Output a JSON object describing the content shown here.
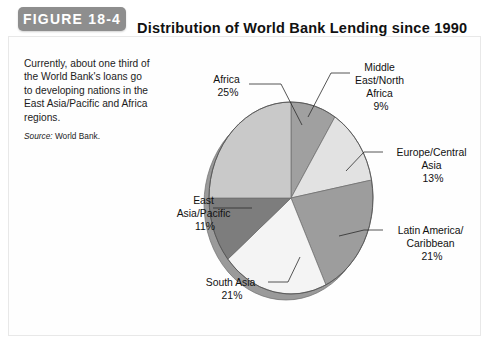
{
  "figure": {
    "tag_label": "FIGURE 18-4",
    "title": "Distribution of World Bank Lending since 1990"
  },
  "caption": {
    "text": "Currently, about one third of the World Bank's loans go to developing nations in the East Asia/Pacific and Africa regions.",
    "source_label": "Source:",
    "source_value": "World Bank."
  },
  "colors": {
    "figure_tag_bg": "#8e8e8e",
    "pie_shadow": "#9a9a9a",
    "pie_outline": "#6f6f6f",
    "africa": "#c9c9c9",
    "middle_east_north_africa": "#a0a0a0",
    "europe_central_asia": "#e2e2e2",
    "latin_america_caribbean": "#9d9d9d",
    "south_asia": "#f4f4f4",
    "east_asia_pacific": "#7d7d7d"
  },
  "chart_data": {
    "type": "pie",
    "title": "Distribution of World Bank Lending since 1990",
    "units": "percent",
    "legend": "none",
    "labels_outside": true,
    "start_angle_deg": 0,
    "direction": "clockwise",
    "categories": [
      "Middle East/North Africa",
      "Europe/Central Asia",
      "Latin America/Caribbean",
      "South Asia",
      "East Asia/Pacific",
      "Africa"
    ],
    "values": [
      9,
      13,
      21,
      21,
      11,
      25
    ],
    "slices": [
      {
        "name": "Middle East/North Africa",
        "label_lines": [
          "Middle",
          "East/North",
          "Africa",
          "9%"
        ],
        "value": 9,
        "value_text": "9%",
        "color": "#a0a0a0"
      },
      {
        "name": "Europe/Central Asia",
        "label_lines": [
          "Europe/Central",
          "Asia",
          "13%"
        ],
        "value": 13,
        "value_text": "13%",
        "color": "#e2e2e2"
      },
      {
        "name": "Latin America/Caribbean",
        "label_lines": [
          "Latin America/",
          "Caribbean",
          "21%"
        ],
        "value": 21,
        "value_text": "21%",
        "color": "#9d9d9d"
      },
      {
        "name": "South Asia",
        "label_lines": [
          "South Asia",
          "21%"
        ],
        "value": 21,
        "value_text": "21%",
        "color": "#f4f4f4"
      },
      {
        "name": "East Asia/Pacific",
        "label_lines": [
          "East",
          "Asia/Pacific",
          "11%"
        ],
        "value": 11,
        "value_text": "11%",
        "color": "#7d7d7d"
      },
      {
        "name": "Africa",
        "label_lines": [
          "Africa",
          "25%"
        ],
        "value": 25,
        "value_text": "25%",
        "color": "#c9c9c9"
      }
    ]
  },
  "labels": {
    "africa_l1": "Africa",
    "africa_l2": "25%",
    "mena_l1": "Middle",
    "mena_l2": "East/North",
    "mena_l3": "Africa",
    "mena_l4": "9%",
    "eca_l1": "Europe/Central",
    "eca_l2": "Asia",
    "eca_l3": "13%",
    "lac_l1": "Latin America/",
    "lac_l2": "Caribbean",
    "lac_l3": "21%",
    "sa_l1": "South Asia",
    "sa_l2": "21%",
    "eap_l1": "East",
    "eap_l2": "Asia/Pacific",
    "eap_l3": "11%"
  }
}
